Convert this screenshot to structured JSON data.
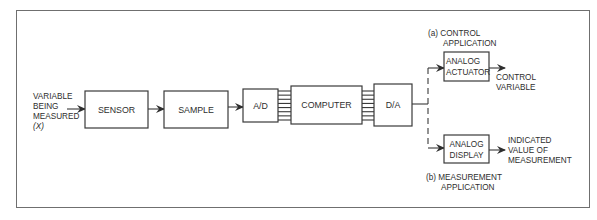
{
  "diagram": {
    "input_label": [
      "VARIABLE",
      "BEING",
      "MEASURED",
      "(X)"
    ],
    "blocks": {
      "sensor": "SENSOR",
      "sample": "SAMPLE",
      "ad": "A/D",
      "computer": "COMPUTER",
      "da": "D/A",
      "actuator": [
        "ANALOG",
        "ACTUATOR"
      ],
      "display": [
        "ANALOG",
        "DISPLAY"
      ]
    },
    "branch_a": {
      "title": [
        "(a) CONTROL",
        "APPLICATION"
      ],
      "output": [
        "CONTROL",
        "VARIABLE"
      ]
    },
    "branch_b": {
      "title": [
        "(b) MEASUREMENT",
        "APPLICATION"
      ],
      "output": [
        "INDICATED",
        "VALUE OF",
        "MEASUREMENT"
      ]
    },
    "bus_line_count": 8
  }
}
